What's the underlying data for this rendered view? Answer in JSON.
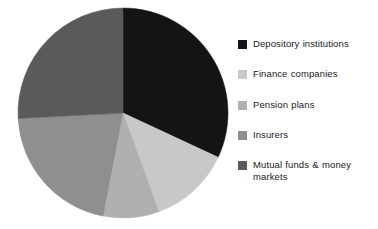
{
  "chart_data": {
    "type": "pie",
    "title": "",
    "subtitle": "",
    "xlabel": "",
    "ylabel": "",
    "grid": false,
    "legend_position": "right",
    "start_angle_deg": 0,
    "direction": "clockwise",
    "categories": [
      "Depository institutions",
      "Finance companies",
      "Pension plans",
      "Insurers",
      "Mutual funds & money markets"
    ],
    "values": [
      31.9,
      12.5,
      8.6,
      21.1,
      25.9
    ],
    "units": "percent",
    "slices": [
      {
        "label": "Depository institutions",
        "value": 31.9,
        "color": "#141414",
        "start_deg": 0,
        "end_deg": 115
      },
      {
        "label": "Finance companies",
        "value": 12.5,
        "color": "#c8c8c8",
        "start_deg": 115,
        "end_deg": 160
      },
      {
        "label": "Pension plans",
        "value": 8.6,
        "color": "#b0b0b0",
        "start_deg": 160,
        "end_deg": 191
      },
      {
        "label": "Insurers",
        "value": 21.1,
        "color": "#8f8f8f",
        "start_deg": 191,
        "end_deg": 267
      },
      {
        "label": "Mutual funds & money markets",
        "value": 25.9,
        "color": "#5a5a5a",
        "start_deg": 267,
        "end_deg": 360
      }
    ]
  },
  "legend": {
    "items": [
      {
        "label": "Depository institutions",
        "color": "#141414",
        "top": 38
      },
      {
        "label": "Finance companies",
        "color": "#c8c8c8",
        "top": 68
      },
      {
        "label": "Pension plans",
        "color": "#b0b0b0",
        "top": 99
      },
      {
        "label": "Insurers",
        "color": "#8f8f8f",
        "top": 129
      },
      {
        "label": "Mutual funds & money markets",
        "color": "#5a5a5a",
        "top": 159
      }
    ]
  },
  "pie_geometry": {
    "center_x": 123,
    "center_y": 113,
    "radius": 105
  }
}
